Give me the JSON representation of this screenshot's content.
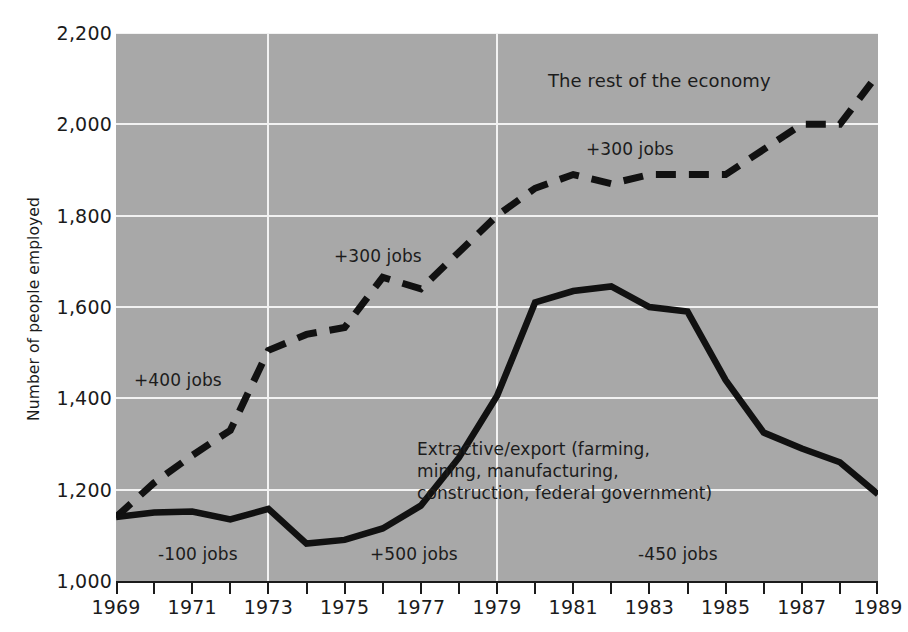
{
  "chart_data": {
    "type": "line",
    "title": "",
    "xlabel": "",
    "ylabel": "Number of people employed",
    "xlim": [
      1969,
      1989
    ],
    "ylim": [
      1000,
      2200
    ],
    "yticks": [
      1000,
      1200,
      1400,
      1600,
      1800,
      2000,
      2200
    ],
    "ytick_labels": [
      "1,000",
      "1,200",
      "1,400",
      "1,600",
      "1,800",
      "2,000",
      "2,200"
    ],
    "xticks": [
      1969,
      1970,
      1971,
      1972,
      1973,
      1974,
      1975,
      1976,
      1977,
      1978,
      1979,
      1980,
      1981,
      1982,
      1983,
      1984,
      1985,
      1986,
      1987,
      1988,
      1989
    ],
    "xtick_labels": [
      "1969",
      "",
      "1971",
      "",
      "1973",
      "",
      "1975",
      "",
      "1977",
      "",
      "1979",
      "",
      "1981",
      "",
      "1983",
      "",
      "1985",
      "",
      "1987",
      "",
      "1989"
    ],
    "grid": true,
    "grid_color": "#f2f2f2",
    "plot_background": "#a8a8a8",
    "legend_position": "inline-annotations",
    "x": [
      1969,
      1970,
      1971,
      1972,
      1973,
      1974,
      1975,
      1976,
      1977,
      1978,
      1979,
      1980,
      1981,
      1982,
      1983,
      1984,
      1985,
      1986,
      1987,
      1988,
      1989
    ],
    "series": [
      {
        "name": "The rest of the economy",
        "style": "dashed",
        "color": "#111111",
        "values": [
          1140,
          1215,
          1275,
          1330,
          1505,
          1540,
          1555,
          1665,
          1640,
          1720,
          1800,
          1860,
          1890,
          1870,
          1890,
          1890,
          1890,
          1945,
          2000,
          2000,
          2110
        ]
      },
      {
        "name": "Extractive/export (farming, mining, manufacturing, construction, federal government)",
        "style": "solid",
        "color": "#111111",
        "values": [
          1140,
          1150,
          1152,
          1135,
          1158,
          1082,
          1090,
          1115,
          1165,
          1270,
          1405,
          1610,
          1635,
          1645,
          1600,
          1590,
          1440,
          1325,
          1290,
          1260,
          1190
        ]
      }
    ],
    "series_actual": [
      {
        "name": "rest-of-economy",
        "points": [
          [
            1969,
            1140
          ],
          [
            1970,
            1215
          ],
          [
            1971,
            1275
          ],
          [
            1972,
            1330
          ],
          [
            1973,
            1505
          ],
          [
            1974,
            1540
          ],
          [
            1975,
            1555
          ],
          [
            1976,
            1665
          ],
          [
            1977,
            1640
          ],
          [
            1978,
            1720
          ],
          [
            1979,
            1800
          ],
          [
            1980,
            1860
          ],
          [
            1981,
            1890
          ],
          [
            1982,
            1870
          ],
          [
            1983,
            1890
          ],
          [
            1984,
            1890
          ],
          [
            1985,
            1890
          ],
          [
            1986,
            1945
          ],
          [
            1987,
            2000
          ],
          [
            1988,
            2000
          ],
          [
            1989,
            2110
          ]
        ]
      },
      {
        "name": "extractive-export",
        "points": [
          [
            1969,
            1140
          ],
          [
            1970,
            1150
          ],
          [
            1971,
            1152
          ],
          [
            1972,
            1135
          ],
          [
            1973,
            1158
          ],
          [
            1974,
            1082
          ],
          [
            1975,
            1090
          ],
          [
            1976,
            1115
          ],
          [
            1977,
            1165
          ],
          [
            1978,
            1270
          ],
          [
            1979,
            1405
          ],
          [
            1980,
            1610
          ],
          [
            1981,
            1635
          ],
          [
            1982,
            1645
          ],
          [
            1983,
            1600
          ],
          [
            1984,
            1590
          ],
          [
            1985,
            1440
          ],
          [
            1986,
            1325
          ],
          [
            1987,
            1290
          ],
          [
            1988,
            1260
          ],
          [
            1989,
            1190
          ]
        ]
      }
    ],
    "annotations": [
      {
        "name": "rest-of-economy-label",
        "text": "The rest of the economy"
      },
      {
        "name": "plus-300-jobs-upper",
        "text": "+300 jobs"
      },
      {
        "name": "plus-300-jobs-mid",
        "text": "+300 jobs"
      },
      {
        "name": "plus-400-jobs",
        "text": "+400 jobs"
      },
      {
        "name": "minus-100-jobs",
        "text": "-100 jobs"
      },
      {
        "name": "plus-500-jobs",
        "text": "+500 jobs"
      },
      {
        "name": "minus-450-jobs",
        "text": "-450 jobs"
      }
    ]
  },
  "axis": {
    "y_title": "Number of people employed",
    "y_labels": [
      "2,200",
      "2,000",
      "1,800",
      "1,600",
      "1,400",
      "1,200",
      "1,000"
    ],
    "x_labels": [
      "1969",
      "1971",
      "1973",
      "1975",
      "1977",
      "1979",
      "1981",
      "1983",
      "1985",
      "1987",
      "1989"
    ]
  },
  "annotations": {
    "rest_of_economy": "The rest of the economy",
    "plus_300_upper": "+300 jobs",
    "plus_300_mid": "+300 jobs",
    "plus_400": "+400 jobs",
    "minus_100": "-100 jobs",
    "plus_500": "+500 jobs",
    "minus_450": "-450 jobs",
    "extractive_line1": "Extractive/export (farming,",
    "extractive_line2": "mining, manufacturing,",
    "extractive_line3": "construction, federal government)"
  }
}
